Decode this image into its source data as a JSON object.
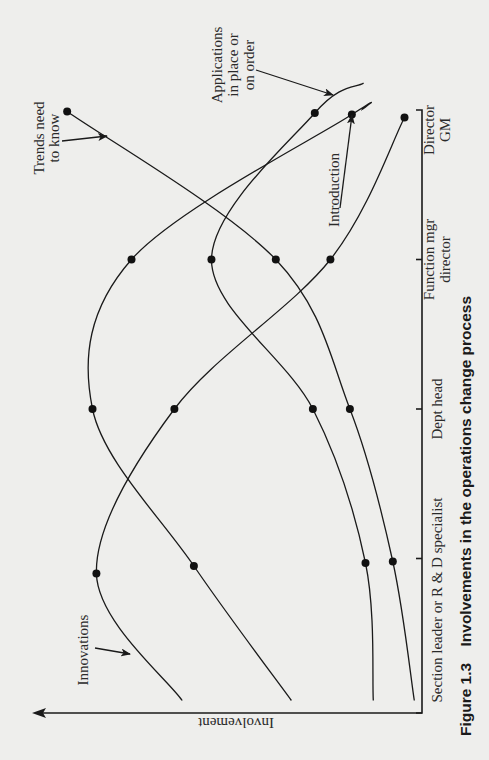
{
  "figure": {
    "caption_number": "Figure 1.3",
    "caption_text": "Involvements in the operations change process"
  },
  "chart_data": {
    "type": "line",
    "title": "Involvements in the operations change process",
    "xlabel": "Organisational level",
    "ylabel": "Involvement",
    "orientation": "rotated 90° counter-clockwise (level axis runs bottom-to-top on the right, involvement axis runs right-to-left along the bottom)",
    "categories": [
      "Section leader or R & D specialist",
      "Dept head",
      "Function mgr director",
      "Director GM"
    ],
    "category_lines": [
      [
        "Section leader or R & D specialist"
      ],
      [
        "Dept head"
      ],
      [
        "Function mgr",
        "director"
      ],
      [
        "Director",
        "GM"
      ]
    ],
    "ylim": [
      0,
      100
    ],
    "y_ticks": "none (qualitative axis)",
    "grid": false,
    "legend": "direct labels with arrows",
    "series": [
      {
        "name": "Innovations",
        "label_lines": [
          "Innovations"
        ],
        "points": [
          [
            0.05,
            62
          ],
          [
            0.9,
            84
          ],
          [
            2.0,
            64
          ],
          [
            3.0,
            24
          ],
          [
            3.95,
            5
          ]
        ],
        "markers": [
          false,
          true,
          true,
          true,
          true
        ],
        "values_at_categories": [
          84,
          64,
          24,
          5
        ]
      },
      {
        "name": "Introduction",
        "label_lines": [
          "Introduction"
        ],
        "points": [
          [
            0.05,
            34
          ],
          [
            0.95,
            59
          ],
          [
            2.0,
            85
          ],
          [
            3.0,
            75
          ],
          [
            3.97,
            18.5
          ],
          [
            4.0,
            16
          ]
        ],
        "markers": [
          false,
          true,
          true,
          true,
          true,
          false
        ],
        "values_at_categories": [
          59,
          85,
          75,
          18.5
        ]
      },
      {
        "name": "Applications in place or on order",
        "label_lines": [
          "Applications",
          "in place or",
          "on order"
        ],
        "points": [
          [
            0.05,
            13
          ],
          [
            0.97,
            15
          ],
          [
            2.0,
            28.5
          ],
          [
            3.0,
            54.5
          ],
          [
            3.98,
            28
          ],
          [
            4.18,
            15.5
          ]
        ],
        "markers": [
          false,
          true,
          true,
          true,
          true,
          false
        ],
        "values_at_categories": [
          15,
          28.5,
          54.5,
          28
        ]
      },
      {
        "name": "Trends need to know",
        "label_lines": [
          "Trends need",
          "to know"
        ],
        "points": [
          [
            0.05,
            2.5
          ],
          [
            0.98,
            8
          ],
          [
            2.0,
            19
          ],
          [
            3.0,
            38
          ],
          [
            3.99,
            91.5
          ]
        ],
        "markers": [
          false,
          true,
          true,
          true,
          true
        ],
        "values_at_categories": [
          8,
          19,
          38,
          91.5
        ]
      }
    ],
    "annotations": [
      {
        "text": "Innovations",
        "arrow_to_series": "Innovations"
      },
      {
        "text": "Introduction",
        "arrow_to_series": "Introduction"
      },
      {
        "text": "Applications in place or on order",
        "arrow_to_series": "Applications in place or on order"
      },
      {
        "text": "Trends need to know",
        "arrow_to_series": "Trends need to know"
      }
    ]
  },
  "style": {
    "background": "#eeeeec",
    "ink": "#1a1a1a"
  }
}
